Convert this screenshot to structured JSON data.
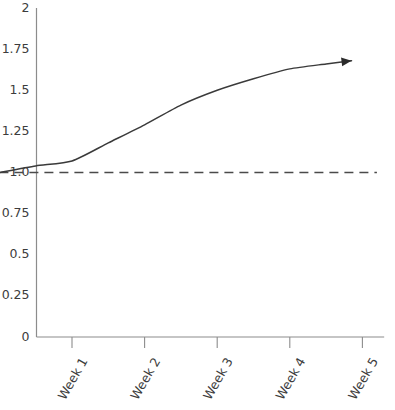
{
  "chart_data": {
    "type": "line",
    "title": "",
    "subtitle": "",
    "xlabel": "",
    "ylabel": "",
    "categories": [
      "Week 1",
      "Week 2",
      "Week 3",
      "Week 4",
      "Week 5"
    ],
    "x": [
      0,
      1,
      2,
      3,
      4,
      5
    ],
    "series": [
      {
        "name": "trend",
        "style": "solid",
        "has_arrow_end": true,
        "points": [
          {
            "x": 0,
            "y": 1.0
          },
          {
            "x": 0.5,
            "y": 1.04
          },
          {
            "x": 1,
            "y": 1.07
          },
          {
            "x": 1.5,
            "y": 1.18
          },
          {
            "x": 2,
            "y": 1.29
          },
          {
            "x": 2.5,
            "y": 1.41
          },
          {
            "x": 3,
            "y": 1.5
          },
          {
            "x": 3.5,
            "y": 1.57
          },
          {
            "x": 4,
            "y": 1.63
          },
          {
            "x": 4.5,
            "y": 1.66
          },
          {
            "x": 4.85,
            "y": 1.68
          }
        ]
      },
      {
        "name": "baseline",
        "style": "dashed",
        "has_arrow_end": false,
        "constant_value": 1.0,
        "points": [
          {
            "x": 0,
            "y": 1.0
          },
          {
            "x": 5.2,
            "y": 1.0
          }
        ]
      }
    ],
    "yticks": [
      "0",
      "0.25",
      "0.5",
      "0.75",
      "1.0",
      "1.25",
      "1.5",
      "1.75",
      "2"
    ],
    "ytick_values": [
      0,
      0.25,
      0.5,
      0.75,
      1.0,
      1.25,
      1.5,
      1.75,
      2
    ],
    "ylim": [
      0,
      2
    ],
    "xlim": [
      -0.5,
      5.3
    ],
    "grid": false,
    "legend": "none",
    "xtick_label_rotation_deg": -60,
    "colors": {
      "curve": "#3a3a3a",
      "baseline": "#4a4a4a",
      "axis": "#8c8c8c",
      "text": "#3c3c3c",
      "background": "#ffffff"
    }
  }
}
